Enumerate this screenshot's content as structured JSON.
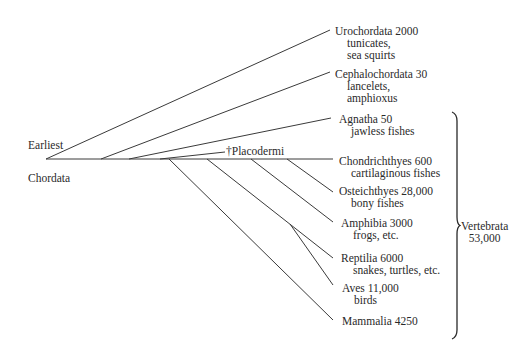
{
  "root": {
    "label_top": "Earliest",
    "label_bottom": "Chordata"
  },
  "taxa": [
    {
      "name": "Urochordata 2000",
      "common": [
        "tunicates,",
        "sea squirts"
      ]
    },
    {
      "name": "Cephalochordata 30",
      "common": [
        "lancelets,",
        "amphioxus"
      ]
    },
    {
      "name": "Agnatha 50",
      "common": [
        "jawless fishes"
      ]
    },
    {
      "name": "†Placodermi",
      "common": []
    },
    {
      "name": "Chondrichthyes 600",
      "common": [
        "cartilaginous fishes"
      ]
    },
    {
      "name": "Osteichthyes 28,000",
      "common": [
        "bony fishes"
      ]
    },
    {
      "name": "Amphibia 3000",
      "common": [
        "frogs, etc."
      ]
    },
    {
      "name": "Reptilia 6000",
      "common": [
        "snakes, turtles, etc."
      ]
    },
    {
      "name": "Aves 11,000",
      "common": [
        "birds"
      ]
    },
    {
      "name": "Mammalia 4250",
      "common": []
    }
  ],
  "group": {
    "name": "Vertebrata",
    "count": "53,000"
  }
}
